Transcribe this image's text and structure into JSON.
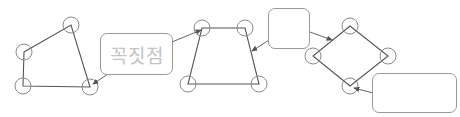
{
  "diagram": {
    "colors": {
      "stroke": "#555555",
      "vertex_circle": "#8a8a8a",
      "box_border": "#9a9a9a",
      "label_text": "#c4c4c4",
      "background": "#ffffff"
    },
    "shapes": [
      {
        "id": "quadrilateral",
        "vertices": [
          [
            24,
            52
          ],
          [
            71,
            25
          ],
          [
            90,
            87
          ],
          [
            23,
            86
          ]
        ]
      },
      {
        "id": "trapezoid",
        "vertices": [
          [
            202,
            28
          ],
          [
            245,
            28
          ],
          [
            259,
            84
          ],
          [
            188,
            84
          ]
        ]
      },
      {
        "id": "rhombus",
        "vertices": [
          [
            350,
            26
          ],
          [
            388,
            56
          ],
          [
            350,
            86
          ],
          [
            313,
            56
          ]
        ]
      }
    ],
    "labels": [
      {
        "id": "vertex-label",
        "text": "꼭짓점",
        "box": [
          100,
          33,
          73,
          42
        ],
        "arrow_to": [
          92,
          85
        ]
      },
      {
        "id": "blank-label-top",
        "text": "",
        "box": [
          268,
          8,
          42,
          41
        ],
        "arrow_to": [
          333,
          40
        ]
      },
      {
        "id": "blank-label-bottom-right",
        "text": "",
        "box": [
          372,
          73,
          85,
          40
        ],
        "arrow_to": [
          353,
          88
        ]
      }
    ],
    "extra_arrows": [
      {
        "from": [
          172,
          44
        ],
        "to": [
          203,
          30
        ]
      },
      {
        "from": [
          268,
          35
        ],
        "to": [
          250,
          55
        ]
      }
    ]
  }
}
